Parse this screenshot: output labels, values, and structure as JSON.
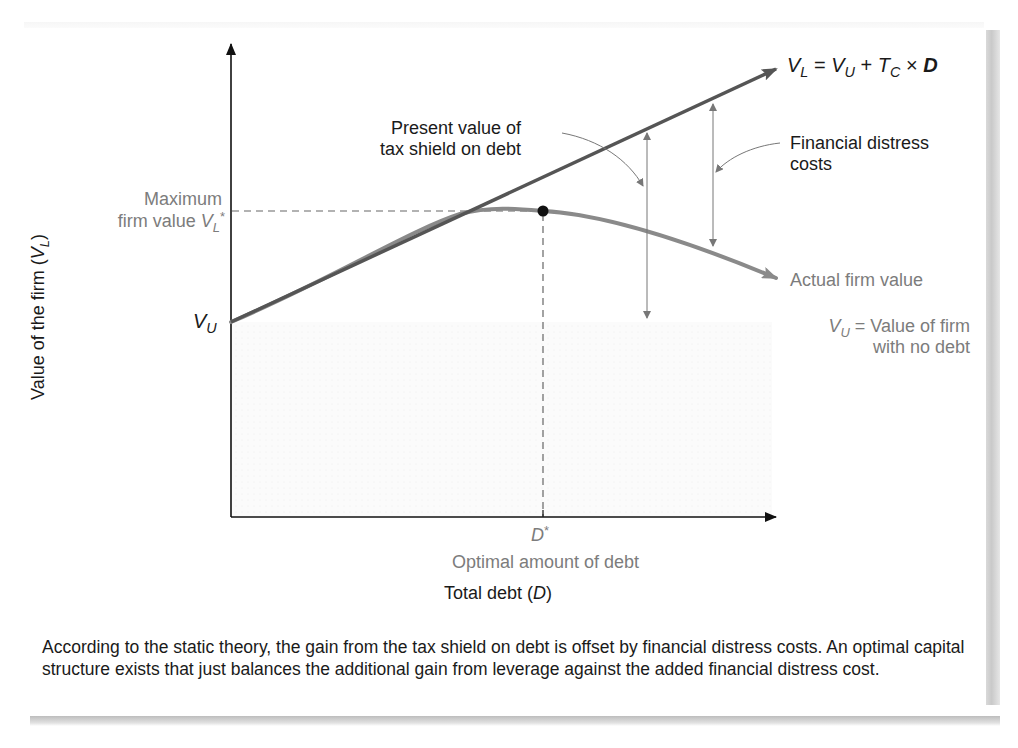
{
  "figure": {
    "equation": {
      "lhs": "V",
      "lhs_sub": "L",
      "eq": " = ",
      "v": "V",
      "v_sub": "U",
      "plus": " + ",
      "t": "T",
      "t_sub": "C",
      "times": " × ",
      "d": "D"
    },
    "y_axis_label": {
      "text": "Value of the firm (",
      "var": "V",
      "var_sub": "L",
      "close": ")"
    },
    "x_axis_label": {
      "text": "Total debt (",
      "var": "D",
      "close": ")"
    },
    "max_value_label": {
      "line1": "Maximum",
      "line2": "firm value ",
      "var": "V",
      "var_sub": "L",
      "star": "*"
    },
    "vu_tick": {
      "var": "V",
      "var_sub": "U"
    },
    "pv_tax_shield_label": {
      "line1": "Present value of",
      "line2": "tax shield on debt"
    },
    "distress_label": {
      "line1": "Financial distress",
      "line2": "costs"
    },
    "actual_value_label": "Actual firm value",
    "vu_def_label": {
      "var": "V",
      "var_sub": "U",
      "line1_rest": " = Value of firm",
      "line2": "with no debt"
    },
    "dstar_label": {
      "var": "D",
      "star": "*"
    },
    "optimal_label": "Optimal amount of debt",
    "caption": "According to the static theory, the gain from the tax shield on debt is offset by financial distress costs. An optimal capital structure exists that just balances the additional gain from leverage against the added financial distress cost."
  },
  "colors": {
    "axis": "#111111",
    "levered_line": "#555555",
    "actual_curve": "#8a8a8a",
    "dashed": "#666666",
    "grey_text": "#7c7c7c",
    "dark_text": "#1a1a1a"
  }
}
